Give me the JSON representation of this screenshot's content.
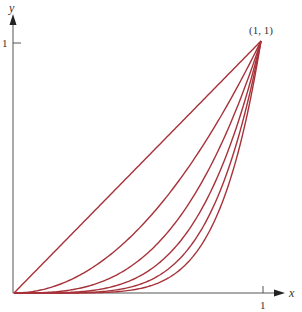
{
  "chart_data": {
    "type": "line",
    "title": "",
    "xlabel": "x",
    "ylabel": "y",
    "xlim": [
      0,
      1
    ],
    "ylim": [
      0,
      1
    ],
    "x_ticks": [
      "1"
    ],
    "y_ticks": [
      "1"
    ],
    "grid": false,
    "legend": null,
    "annotations": [
      {
        "text": "(1, 1)",
        "x": 1,
        "y": 1
      }
    ],
    "series": [
      {
        "name": "y = x",
        "power": 1
      },
      {
        "name": "y = x^2",
        "power": 2
      },
      {
        "name": "y = x^3",
        "power": 3
      },
      {
        "name": "y = x^4",
        "power": 4
      },
      {
        "name": "y = x^5",
        "power": 5
      },
      {
        "name": "y = x^6",
        "power": 6
      }
    ],
    "curve_color": "#a8323a",
    "axis_color": "#555555"
  },
  "labels": {
    "x_axis": "x",
    "y_axis": "y",
    "x_tick": "1",
    "y_tick": "1",
    "point": "(1, 1)"
  }
}
